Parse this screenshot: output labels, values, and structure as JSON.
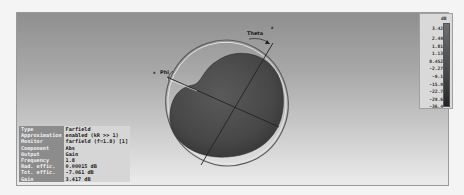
{
  "plot": {
    "labels": {
      "theta": "Theta",
      "phi": "Phi",
      "z_axis": "z",
      "x_axis": "x"
    }
  },
  "info_table": {
    "rows": [
      {
        "label": "Type",
        "value": "Farfield"
      },
      {
        "label": "Approximation",
        "value": "enabled (kR >> 1)"
      },
      {
        "label": "Monitor",
        "value": "farfield (f=1.8) [1]"
      },
      {
        "label": "Component",
        "value": "Abs"
      },
      {
        "label": "Output",
        "value": "Gain"
      },
      {
        "label": "Frequency",
        "value": "1.8"
      },
      {
        "label": "Rad. effic.",
        "value": "0.00015 dB"
      },
      {
        "label": "Tot. effic.",
        "value": "-7.061 dB"
      },
      {
        "label": "Gain",
        "value": "3.417 dB"
      }
    ]
  },
  "legend": {
    "unit": "dB",
    "ticks": [
      "3.42",
      "2.49",
      "1.81",
      "1.13",
      "0.452",
      "-2.27",
      "-9.1",
      "-15.9",
      "-22.7",
      "-29.6",
      "-36.4"
    ],
    "colors": {
      "top": "#6e6e6e",
      "bottom": "#222222"
    }
  }
}
